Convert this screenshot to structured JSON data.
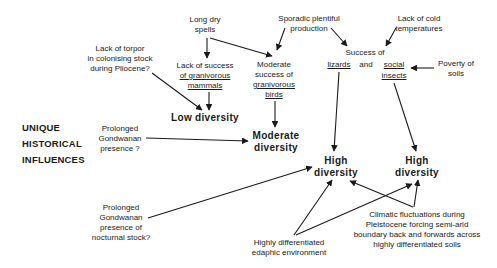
{
  "heading": {
    "lines": [
      "UNIQUE",
      "HISTORICAL",
      "INFLUENCES"
    ]
  },
  "nodes": {
    "long_dry": {
      "lines": [
        "Long dry",
        "spells"
      ]
    },
    "sporadic": {
      "lines": [
        "Sporadic plentiful",
        "production"
      ]
    },
    "cold": {
      "lines": [
        "Lack of cold",
        "temperatures"
      ]
    },
    "torpor": {
      "lines": [
        "Lack of torpor",
        "in colonising stock",
        "during Pliocene?"
      ]
    },
    "lack_mammals": {
      "lines": [
        "Lack of success",
        "of granivorous",
        "mammals"
      ]
    },
    "mod_birds": {
      "lines": [
        "Moderate",
        "success of",
        "granivorous",
        "birds"
      ]
    },
    "success_of": {
      "text": "Success of"
    },
    "lizards": {
      "text": "lizards"
    },
    "and": {
      "text": "and"
    },
    "social": {
      "lines": [
        "social",
        "insects"
      ]
    },
    "poverty": {
      "lines": [
        "Poverty of",
        "soils"
      ]
    },
    "low_div": {
      "text": "Low diversity"
    },
    "mod_div": {
      "lines": [
        "Moderate",
        "diversity"
      ]
    },
    "high_div_1": {
      "lines": [
        "High",
        "diversity"
      ]
    },
    "high_div_2": {
      "lines": [
        "High",
        "diversity"
      ]
    },
    "gond1": {
      "lines": [
        "Prolonged",
        "Gondwanan",
        "presence ?"
      ]
    },
    "gond2": {
      "lines": [
        "Prolonged",
        "Gondwanan",
        "presence  of",
        "nocturnal stock?"
      ]
    },
    "edaphic": {
      "lines": [
        "Highly differentiated",
        "edaphic environment"
      ]
    },
    "climatic": {
      "lines": [
        "Climatic fluctuations during",
        "Pleistocene forcing semi-arid",
        "boundary back and forwards across",
        "highly differentiated soils"
      ]
    }
  },
  "colors": {
    "ink": "#1a1a1a",
    "background": "#ffffff"
  }
}
